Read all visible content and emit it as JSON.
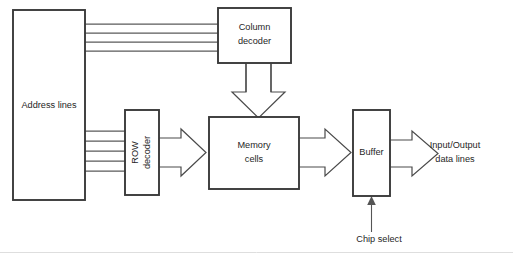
{
  "diagram": {
    "background_color": "#ffffff",
    "line_color": "#3a3a3a",
    "text_color": "#262626",
    "blocks": [
      {
        "id": "address-lines",
        "label": "Address lines",
        "x": 13,
        "y": 10,
        "w": 72,
        "h": 190
      },
      {
        "id": "column-decoder",
        "label_line1": "Column",
        "label_line2": "decoder",
        "x": 218,
        "y": 8,
        "w": 73,
        "h": 55
      },
      {
        "id": "row-decoder",
        "label_line1": "ROW",
        "label_line2": "decoder",
        "x": 125,
        "y": 110,
        "w": 34,
        "h": 85
      },
      {
        "id": "memory-cells",
        "label_line1": "Memory",
        "label_line2": "cells",
        "x": 209,
        "y": 117,
        "w": 90,
        "h": 72
      },
      {
        "id": "buffer",
        "label": "Buffer",
        "x": 353,
        "y": 110,
        "w": 37,
        "h": 86
      }
    ],
    "free_labels": [
      {
        "id": "io-data-lines",
        "line1": "Input/Output",
        "line2": "data lines",
        "x": 455,
        "y": 145
      },
      {
        "id": "chip-select",
        "text": "Chip select",
        "x": 379,
        "y": 240
      }
    ],
    "buses": [
      {
        "id": "address-to-column-decoder",
        "line_count": 4,
        "from": "address-lines",
        "to": "column-decoder"
      },
      {
        "id": "address-to-row-decoder",
        "line_count": 5,
        "from": "address-lines",
        "to": "row-decoder"
      }
    ],
    "arrows": [
      {
        "id": "column-decoder-to-memory-cells",
        "direction": "down",
        "style": "hollow"
      },
      {
        "id": "row-decoder-to-memory-cells",
        "direction": "right",
        "style": "hollow"
      },
      {
        "id": "memory-cells-to-buffer",
        "direction": "right",
        "style": "hollow"
      },
      {
        "id": "buffer-to-io-data-lines",
        "direction": "right",
        "style": "open"
      },
      {
        "id": "chip-select-to-buffer",
        "direction": "up",
        "style": "thin"
      }
    ]
  }
}
